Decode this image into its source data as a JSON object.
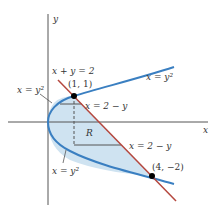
{
  "axes": {
    "x_label": "x",
    "y_label": "y"
  },
  "curves": {
    "parabola": {
      "equation": "x = y²",
      "color": "#3a7fc1"
    },
    "line": {
      "equation": "x + y = 2",
      "color": "#b5473e"
    }
  },
  "region": {
    "label": "R",
    "fill": "#cfe3f1"
  },
  "points": [
    {
      "label": "(1, 1)",
      "x": 1,
      "y": 1
    },
    {
      "label": "(4, −2)",
      "x": 4,
      "y": -2
    }
  ],
  "labels": {
    "line_top": "x + y = 2",
    "parabola_upper_right": "x = y²",
    "parabola_left_upper": "x = y²",
    "parabola_left_lower": "x = y²",
    "strip_upper": "x = 2 − y",
    "strip_lower": "x = 2 − y"
  }
}
